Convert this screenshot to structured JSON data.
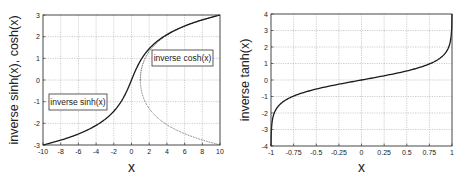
{
  "chart_data": [
    {
      "type": "line",
      "title": "",
      "xlabel": "x",
      "ylabel": "inverse sinh(x), cosh(x)",
      "xlim": [
        -10,
        10
      ],
      "ylim": [
        -3,
        3
      ],
      "xticks": [
        "-10",
        "-8",
        "-6",
        "-4",
        "-2",
        "0",
        "2",
        "4",
        "6",
        "8",
        "10"
      ],
      "yticks": [
        "-3",
        "-2",
        "-1",
        "0",
        "1",
        "2",
        "3"
      ],
      "grid": true,
      "legend": "inline annotations",
      "annotations": [
        {
          "text": "inverse sinh(x)",
          "x": -6.3,
          "y": -1.0
        },
        {
          "text": "inverse cosh(x)",
          "x": 5.6,
          "y": 1.0
        }
      ],
      "series": [
        {
          "name": "inverse sinh(x)",
          "style": "solid",
          "x": [
            -10,
            -8,
            -6,
            -4,
            -2,
            -1,
            0,
            1,
            2,
            4,
            6,
            8,
            10
          ],
          "y": [
            -3.0,
            -2.78,
            -2.49,
            -2.09,
            -1.44,
            -0.88,
            0,
            0.88,
            1.44,
            2.09,
            2.49,
            2.78,
            3.0
          ]
        },
        {
          "name": "inverse cosh(x)",
          "style": "dotted (both branches ±)",
          "x": [
            1,
            1.5,
            2,
            4,
            6,
            8,
            10
          ],
          "y_upper": [
            0,
            0.96,
            1.32,
            2.06,
            2.48,
            2.77,
            2.99
          ],
          "y_lower": [
            0,
            -0.96,
            -1.32,
            -2.06,
            -2.48,
            -2.77,
            -2.99
          ]
        }
      ]
    },
    {
      "type": "line",
      "title": "",
      "xlabel": "x",
      "ylabel": "inverse tanh(x)",
      "xlim": [
        -1,
        1
      ],
      "ylim": [
        -4,
        4
      ],
      "xticks": [
        "-1",
        "-0.75",
        "-0.5",
        "-0.25",
        "0",
        "0.25",
        "0.5",
        "0.75",
        "1"
      ],
      "yticks": [
        "-4",
        "-3",
        "-2",
        "-1",
        "0",
        "1",
        "2",
        "3",
        "4"
      ],
      "grid": true,
      "series": [
        {
          "name": "inverse tanh(x)",
          "style": "solid",
          "x": [
            -0.9993,
            -0.99,
            -0.95,
            -0.9,
            -0.75,
            -0.5,
            -0.25,
            0,
            0.25,
            0.5,
            0.75,
            0.9,
            0.95,
            0.99,
            0.9993
          ],
          "y": [
            -4.0,
            -2.65,
            -1.83,
            -1.47,
            -0.97,
            -0.55,
            -0.26,
            0,
            0.26,
            0.55,
            0.97,
            1.47,
            1.83,
            2.65,
            4.0
          ]
        }
      ]
    }
  ],
  "left_chart": {
    "xlabel": "x",
    "ylabel": "inverse sinh(x), cosh(x)",
    "xticks": [
      "-10",
      "-8",
      "-6",
      "-4",
      "-2",
      "0",
      "2",
      "4",
      "6",
      "8",
      "10"
    ],
    "yticks": [
      "-3",
      "-2",
      "-1",
      "0",
      "1",
      "2",
      "3"
    ],
    "label_sinh": "inverse sinh(x)",
    "label_cosh": "inverse cosh(x)"
  },
  "right_chart": {
    "xlabel": "x",
    "ylabel": "inverse tanh(x)",
    "xticks": [
      "-1",
      "-0.75",
      "-0.5",
      "-0.25",
      "0",
      "0.25",
      "0.5",
      "0.75",
      "1"
    ],
    "yticks": [
      "-4",
      "-3",
      "-2",
      "-1",
      "0",
      "1",
      "2",
      "3",
      "4"
    ]
  },
  "colors": {
    "line": "#1a1a1a",
    "grid": "#9a9a9a",
    "frame": "#333333"
  }
}
